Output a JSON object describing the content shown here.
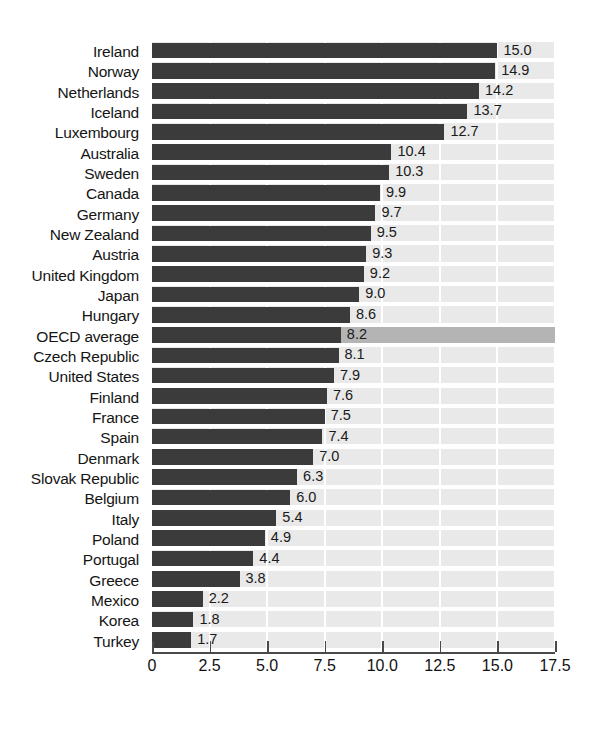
{
  "chart_data": {
    "type": "bar",
    "orientation": "horizontal",
    "title": "",
    "subtitle": "",
    "xlabel": "",
    "ylabel": "",
    "xlim": [
      0,
      17.5
    ],
    "xticks": [
      "0",
      "2.5",
      "5.0",
      "7.5",
      "10.0",
      "12.5",
      "15.0",
      "17.5"
    ],
    "xtick_values": [
      0,
      2.5,
      5.0,
      7.5,
      10.0,
      12.5,
      15.0,
      17.5
    ],
    "grid": "vertical-white-on-gray",
    "legend": "none",
    "highlight_category": "OECD average",
    "categories": [
      "Ireland",
      "Norway",
      "Netherlands",
      "Iceland",
      "Luxembourg",
      "Australia",
      "Sweden",
      "Canada",
      "Germany",
      "New Zealand",
      "Austria",
      "United Kingdom",
      "Japan",
      "Hungary",
      "OECD average",
      "Czech Republic",
      "United States",
      "Finland",
      "France",
      "Spain",
      "Denmark",
      "Slovak Republic",
      "Belgium",
      "Italy",
      "Poland",
      "Portugal",
      "Greece",
      "Mexico",
      "Korea",
      "Turkey"
    ],
    "values": [
      15.0,
      14.9,
      14.2,
      13.7,
      12.7,
      10.4,
      10.3,
      9.9,
      9.7,
      9.5,
      9.3,
      9.2,
      9.0,
      8.6,
      8.2,
      8.1,
      7.9,
      7.6,
      7.5,
      7.4,
      7.0,
      6.3,
      6.0,
      5.4,
      4.9,
      4.4,
      3.8,
      2.2,
      1.8,
      1.7
    ],
    "value_labels": [
      "15.0",
      "14.9",
      "14.2",
      "13.7",
      "12.7",
      "10.4",
      "10.3",
      "9.9",
      "9.7",
      "9.5",
      "9.3",
      "9.2",
      "9.0",
      "8.6",
      "8.2",
      "8.1",
      "7.9",
      "7.6",
      "7.5",
      "7.4",
      "7.0",
      "6.3",
      "6.0",
      "5.4",
      "4.9",
      "4.4",
      "3.8",
      "2.2",
      "1.8",
      "1.7"
    ],
    "colors": {
      "bar": "#3b3b3b",
      "plot_background": "#e9e9e9",
      "gridline": "#ffffff",
      "highlight_row": "#b4b4b4",
      "axis": "#4a4a4a",
      "text": "#111111",
      "page_background": "#ffffff"
    }
  }
}
